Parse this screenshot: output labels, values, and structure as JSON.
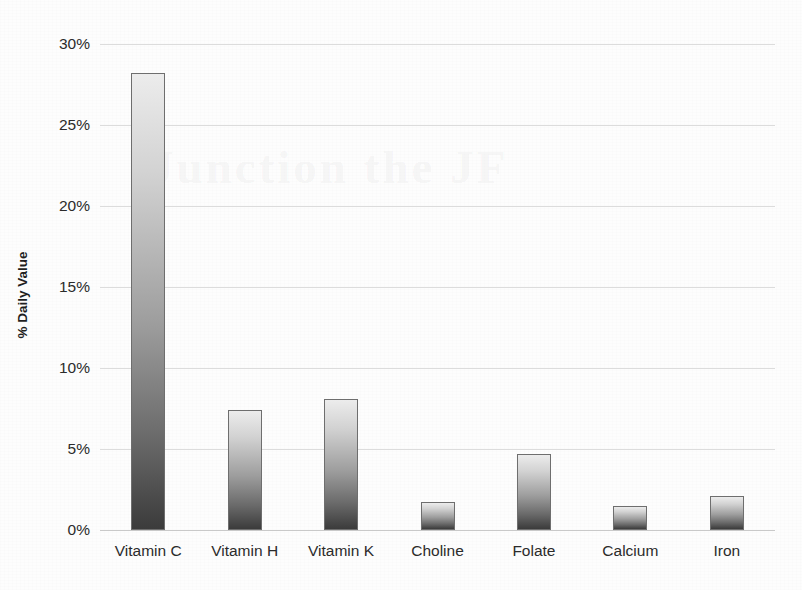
{
  "chart_data": {
    "type": "bar",
    "title": "",
    "xlabel": "",
    "ylabel": "% Daily Value",
    "ylim": [
      0,
      30
    ],
    "ytick_labels": [
      "30%",
      "25%",
      "20%",
      "15%",
      "10%",
      "5%",
      "0%"
    ],
    "ytick_values": [
      30,
      25,
      20,
      15,
      10,
      5,
      0
    ],
    "grid": true,
    "legend": "none",
    "categories": [
      "Vitamin C",
      "Vitamin H",
      "Vitamin K",
      "Choline",
      "Folate",
      "Calcium",
      "Iron"
    ],
    "values": [
      28.2,
      7.4,
      8.1,
      1.7,
      4.7,
      1.5,
      2.1
    ],
    "units": "percent",
    "bar_style": {
      "fill_top": "#ececec",
      "fill_bottom": "#3b3b3b",
      "border": "#6e6e6e"
    },
    "grid_color": "#dcdcdc",
    "text_color": "#2b2b2b"
  },
  "ghost": {
    "bleed_text": "Junction  the  JF"
  }
}
